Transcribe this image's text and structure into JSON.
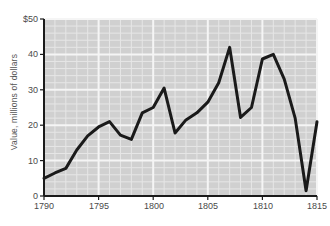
{
  "chart_data": {
    "type": "line",
    "title": "",
    "subtitle": "",
    "xlabel": "",
    "ylabel": "Value, millions of dollars",
    "xlim": [
      1790,
      1815
    ],
    "ylim": [
      0,
      50
    ],
    "grid": true,
    "legend": null,
    "x_tick_labels": [
      "1790",
      "1795",
      "1800",
      "1805",
      "1810",
      "1815"
    ],
    "x_tick_values": [
      1790,
      1795,
      1800,
      1805,
      1810,
      1815
    ],
    "y_tick_labels": [
      "0",
      "10",
      "20",
      "30",
      "40",
      "$50"
    ],
    "y_tick_values": [
      0,
      10,
      20,
      30,
      40,
      50
    ],
    "x_minor_step": 1,
    "y_minor_step": 2,
    "series": [
      {
        "name": "Value",
        "color": "#1a1a1a",
        "x": [
          1790,
          1791,
          1792,
          1793,
          1794,
          1795,
          1796,
          1797,
          1798,
          1799,
          1800,
          1801,
          1802,
          1803,
          1804,
          1805,
          1806,
          1807,
          1808,
          1809,
          1810,
          1811,
          1812,
          1813,
          1814,
          1815
        ],
        "values": [
          5.0,
          6.5,
          7.8,
          13.0,
          17.0,
          19.5,
          21.0,
          17.2,
          16.0,
          23.5,
          25.0,
          30.5,
          17.8,
          21.5,
          23.5,
          26.5,
          32.0,
          42.0,
          22.2,
          25.0,
          38.7,
          40.0,
          33.0,
          22.0,
          1.5,
          21.0
        ]
      }
    ]
  },
  "axes": {
    "y_title": "Value, millions of dollars",
    "x_ticks": [
      {
        "label": "1790"
      },
      {
        "label": "1795"
      },
      {
        "label": "1800"
      },
      {
        "label": "1805"
      },
      {
        "label": "1810"
      },
      {
        "label": "1815"
      }
    ],
    "y_ticks": [
      {
        "label": "$50"
      },
      {
        "label": "40"
      },
      {
        "label": "30"
      },
      {
        "label": "20"
      },
      {
        "label": "10"
      },
      {
        "label": "0"
      }
    ]
  },
  "colors": {
    "plot_background": "#d0d0d0",
    "gridline_minor": "#e6e6e6",
    "gridline_major": "#f5f5f5",
    "line": "#1a1a1a",
    "axis": "#1a1a1a",
    "tick_text": "#4a4a4a"
  }
}
